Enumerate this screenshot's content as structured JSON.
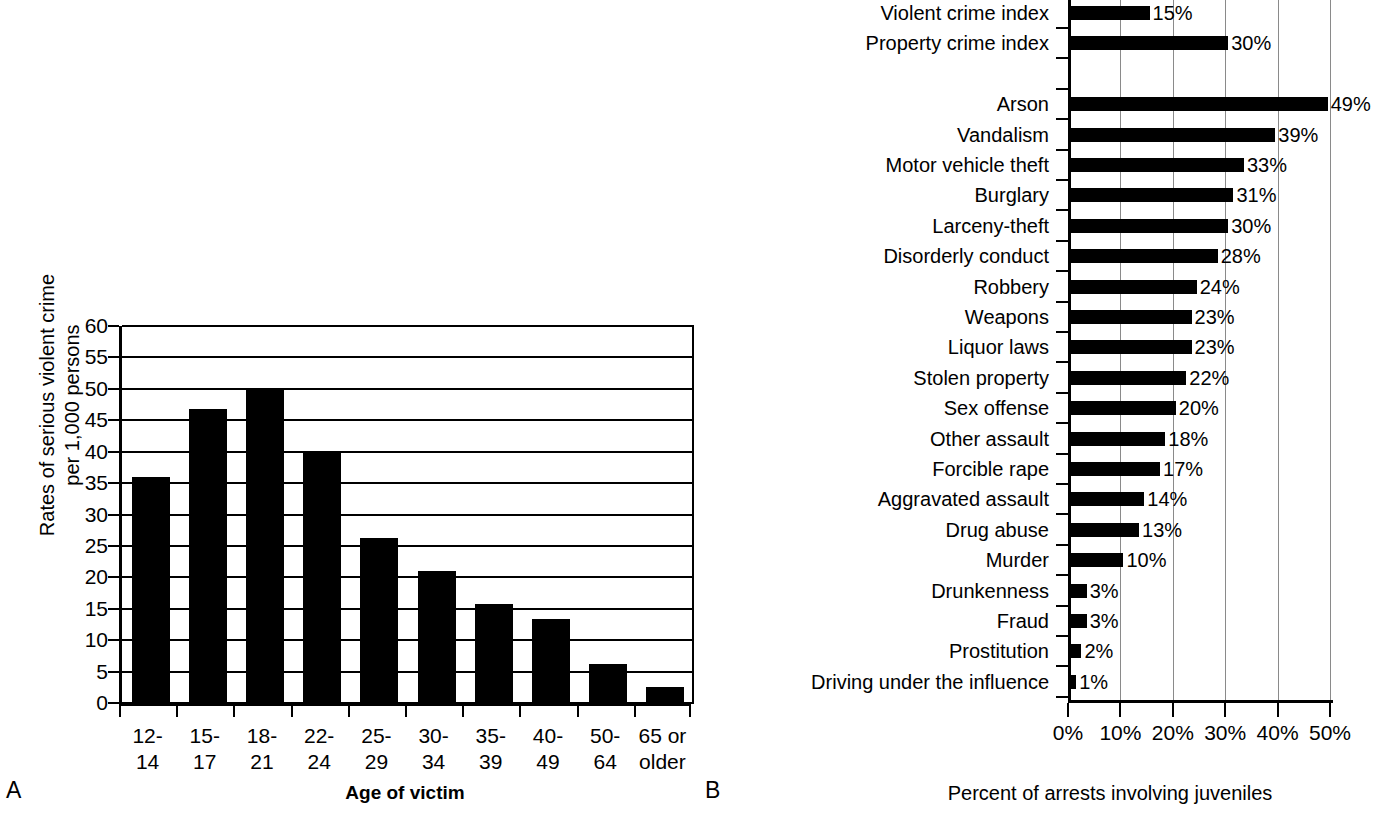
{
  "chart_data": [
    {
      "type": "bar",
      "panel": "A",
      "panel_letter": "A",
      "title": "",
      "xlabel": "Age of victim",
      "ylabel": "Rates of serious violent crime\nper 1,000 persons",
      "categories": [
        "12-\n14",
        "15-\n17",
        "18-\n21",
        "22-\n24",
        "25-\n29",
        "30-\n34",
        "35-\n39",
        "40-\n49",
        "50-\n64",
        "65 or\nolder"
      ],
      "values": [
        36,
        46.8,
        50,
        40,
        26.2,
        21,
        15.8,
        13.4,
        6.2,
        2.5
      ],
      "ylim": [
        0,
        60
      ],
      "yticks": [
        0,
        5,
        10,
        15,
        20,
        25,
        30,
        35,
        40,
        45,
        50,
        55,
        60
      ],
      "ytick_labels": [
        "0",
        "5",
        "10",
        "15",
        "20",
        "25",
        "30",
        "35",
        "40",
        "45",
        "50",
        "55",
        "60"
      ],
      "grid": "horizontal",
      "legend": "none",
      "bar_color": "#000000"
    },
    {
      "type": "bar",
      "orientation": "horizontal",
      "panel": "B",
      "panel_letter": "B",
      "title": "",
      "xlabel": "Percent of arrests involving juveniles",
      "ylabel": "",
      "xlim": [
        0,
        50
      ],
      "xticks": [
        0,
        10,
        20,
        30,
        40,
        50
      ],
      "xtick_labels": [
        "0%",
        "10%",
        "20%",
        "30%",
        "40%",
        "50%"
      ],
      "grid": "vertical",
      "legend": "none",
      "bar_color": "#000000",
      "categories": [
        "Violent crime index",
        "Property crime index",
        "",
        "Arson",
        "Vandalism",
        "Motor vehicle theft",
        "Burglary",
        "Larceny-theft",
        "Disorderly conduct",
        "Robbery",
        "Weapons",
        "Liquor laws",
        "Stolen property",
        "Sex offense",
        "Other assault",
        "Forcible rape",
        "Aggravated assault",
        "Drug abuse",
        "Murder",
        "Drunkenness",
        "Fraud",
        "Prostitution",
        "Driving under the influence"
      ],
      "values": [
        15,
        30,
        null,
        49,
        39,
        33,
        31,
        30,
        28,
        24,
        23,
        23,
        22,
        20,
        18,
        17,
        14,
        13,
        10,
        3,
        3,
        2,
        1
      ],
      "value_labels": [
        "15%",
        "30%",
        "",
        "49%",
        "39%",
        "33%",
        "31%",
        "30%",
        "28%",
        "24%",
        "23%",
        "23%",
        "22%",
        "20%",
        "18%",
        "17%",
        "14%",
        "13%",
        "10%",
        "3%",
        "3%",
        "2%",
        "1%"
      ]
    }
  ]
}
